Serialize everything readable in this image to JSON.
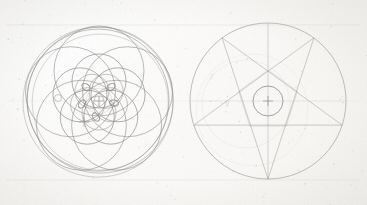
{
  "canvas": {
    "width": 367,
    "height": 205,
    "background_hex": "#fbfbf9",
    "paper_tone_hex": "#f7f6f3"
  },
  "artwork": {
    "title": "Sacred geometry construction sheet",
    "medium_note": "graphite on aged paper",
    "ink_hex": "#8e8c8a",
    "faint_ink_hex": "#c9c7c4",
    "construction_line_hex": "#dedcd8"
  },
  "construction_lines": {
    "upper_rule_y": 25,
    "lower_rule_y": 180,
    "left_rule_x": 6,
    "right_rule_x": 360,
    "mid_rule_y": 101
  },
  "figures": [
    {
      "id": "rosette",
      "label": "five-fold rosette",
      "center": {
        "x": 99,
        "y": 101
      },
      "outer_rings": [
        {
          "r": 75,
          "opacity": 0.55
        },
        {
          "r": 73,
          "opacity": 0.65
        },
        {
          "r": 71,
          "opacity": 0.75
        },
        {
          "r": 68,
          "opacity": 0.45
        }
      ],
      "petal_ring": {
        "count": 5,
        "orbit_r": 30,
        "circle_r": 45,
        "rotation_deg": -90
      },
      "inner_ring": {
        "count": 5,
        "orbit_r": 20,
        "circle_r": 27,
        "rotation_deg": -90
      },
      "core_ring": {
        "count": 5,
        "orbit_r": 12,
        "circle_r": 17,
        "rotation_deg": -54
      },
      "core_disc_r": 13,
      "nodes": [
        {
          "x": 111,
          "y": 87,
          "rx": 4.5,
          "ry": 3.0,
          "rot": -35
        },
        {
          "x": 114,
          "y": 103,
          "rx": 4.5,
          "ry": 3.0,
          "rot": 10
        },
        {
          "x": 96,
          "y": 117,
          "rx": 4.5,
          "ry": 3.0,
          "rot": 55
        },
        {
          "x": 82,
          "y": 104,
          "rx": 4.5,
          "ry": 3.0,
          "rot": -55
        },
        {
          "x": 86,
          "y": 87,
          "rx": 4.5,
          "ry": 3.0,
          "rot": 35
        }
      ],
      "markers": [
        {
          "kind": "cross",
          "x": 99,
          "y": 101,
          "size": 5,
          "opacity": 0.85
        },
        {
          "kind": "cross",
          "x": 84,
          "y": 122,
          "size": 5,
          "opacity": 0.7
        },
        {
          "kind": "small-circle",
          "x": 58,
          "y": 98,
          "r": 3.5,
          "opacity": 0.6
        }
      ]
    },
    {
      "id": "pentagram",
      "label": "pentagram in circle",
      "center": {
        "x": 268,
        "y": 101
      },
      "outer_circle_r": 78,
      "inner_circle_r": 15,
      "pentagram": {
        "vertex_r": 78,
        "rotation_deg": 90,
        "points": 5
      },
      "inner_pentagon_r": 31,
      "axis_line": {
        "from_y": 23,
        "to_y": 179
      },
      "ghost_arcs": [
        {
          "cx": 246,
          "cy": 104,
          "r": 44,
          "opacity": 0.28
        },
        {
          "cx": 252,
          "cy": 110,
          "r": 56,
          "opacity": 0.22
        }
      ],
      "markers": [
        {
          "kind": "cross",
          "x": 268,
          "y": 101,
          "size": 5,
          "opacity": 0.85
        }
      ],
      "symbols": [
        {
          "glyph": "♂",
          "name": "mars-symbol",
          "x": 212,
          "y": 78,
          "size": 11,
          "opacity": 0.45,
          "rot": -20
        },
        {
          "glyph": "♀",
          "name": "venus-symbol",
          "x": 227,
          "y": 105,
          "size": 13,
          "opacity": 0.55,
          "rot": 0
        }
      ]
    }
  ],
  "speckles": {
    "count": 210,
    "color_hex": "#b5b3ae",
    "note": "random paper flecks"
  }
}
